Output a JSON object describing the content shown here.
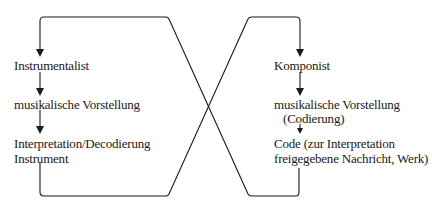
{
  "diagram": {
    "left_cycle": {
      "nodes": [
        {
          "label": "Instrumentalist"
        },
        {
          "label": "musikalische Vorstellung"
        },
        {
          "label": "Interpretation/Decodierung",
          "sublabel": "Instrument"
        }
      ]
    },
    "right_cycle": {
      "nodes": [
        {
          "label": "Komponist"
        },
        {
          "label": "musikalische Vorstellung",
          "sublabel": "(Codierung)"
        },
        {
          "label": "Code (zur Interpretation",
          "sublabel": "freigegebene Nachricht, Werk)"
        }
      ]
    },
    "colors": {
      "line": "#1a1a1a",
      "background": "#ffffff"
    }
  }
}
